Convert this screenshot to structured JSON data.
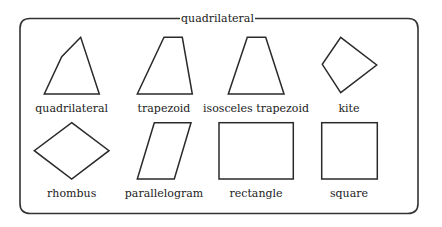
{
  "title": "quadrilateral",
  "colors": {
    "stroke": "#2a2a2a",
    "background": "#ffffff"
  },
  "shapes": [
    {
      "id": "quadrilateral",
      "label": "quadrilateral"
    },
    {
      "id": "trapezoid",
      "label": "trapezoid"
    },
    {
      "id": "isosceles-trapezoid",
      "label": "isosceles trapezoid"
    },
    {
      "id": "kite",
      "label": "kite"
    },
    {
      "id": "rhombus",
      "label": "rhombus"
    },
    {
      "id": "parallelogram",
      "label": "parallelogram"
    },
    {
      "id": "rectangle",
      "label": "rectangle"
    },
    {
      "id": "square",
      "label": "square"
    }
  ]
}
